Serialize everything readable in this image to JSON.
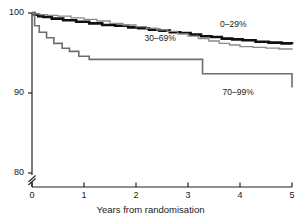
{
  "chart_data": {
    "type": "line",
    "title": "",
    "subtitle": "",
    "xlabel": "Years from randomisation",
    "ylabel": "",
    "xlim": [
      0,
      5
    ],
    "ylim": [
      80,
      100
    ],
    "y_axis_break": true,
    "y_axis_break_note": "axis broken below 80",
    "grid": false,
    "legend_position": "inline-annotations",
    "xticks": [
      "0",
      "1",
      "2",
      "3",
      "4",
      "5"
    ],
    "xtick_values": [
      0,
      1,
      2,
      3,
      4,
      5
    ],
    "yticks": [
      "100",
      "90",
      "80"
    ],
    "ytick_values": [
      100,
      90,
      80
    ],
    "series": [
      {
        "name": "0-29%",
        "label": "0–29%",
        "color": "#111111",
        "line_width": 2.6,
        "style": "step",
        "x": [
          0.0,
          0.05,
          0.12,
          0.22,
          0.38,
          0.6,
          0.85,
          1.1,
          1.35,
          1.6,
          1.85,
          2.05,
          2.25,
          2.45,
          2.65,
          2.85,
          3.05,
          3.25,
          3.45,
          3.65,
          3.85,
          4.05,
          4.3,
          4.55,
          4.8,
          5.0
        ],
        "y": [
          100.0,
          99.8,
          99.6,
          99.5,
          99.3,
          99.1,
          98.9,
          98.7,
          98.5,
          98.4,
          98.2,
          98.1,
          97.9,
          97.8,
          97.6,
          97.5,
          97.3,
          97.1,
          97.0,
          96.8,
          96.7,
          96.6,
          96.4,
          96.3,
          96.2,
          96.1
        ]
      },
      {
        "name": "30-69%",
        "label": "30–69%",
        "color": "#8a8a8a",
        "line_width": 1.3,
        "style": "step",
        "x": [
          0.0,
          0.06,
          0.15,
          0.3,
          0.5,
          0.75,
          1.0,
          1.25,
          1.5,
          1.75,
          2.0,
          2.2,
          2.4,
          2.6,
          2.8,
          3.0,
          3.2,
          3.4,
          3.6,
          3.8,
          4.0,
          4.25,
          4.5,
          4.75,
          5.0
        ],
        "y": [
          100.0,
          99.9,
          99.8,
          99.7,
          99.6,
          99.4,
          99.2,
          99.0,
          98.7,
          98.5,
          98.3,
          98.1,
          97.9,
          97.7,
          97.4,
          97.1,
          96.8,
          96.5,
          96.2,
          96.0,
          95.8,
          95.7,
          95.6,
          95.5,
          95.4
        ]
      },
      {
        "name": "70-99%",
        "label": "70–99%",
        "color": "#6e6e6e",
        "line_width": 1.6,
        "style": "step",
        "x": [
          0.0,
          0.05,
          0.14,
          0.28,
          0.42,
          0.58,
          0.72,
          0.9,
          1.1,
          3.05,
          3.28,
          5.0
        ],
        "y": [
          100.0,
          98.4,
          97.6,
          96.9,
          96.2,
          95.6,
          95.2,
          94.6,
          94.2,
          94.2,
          92.4,
          90.7
        ]
      }
    ],
    "annotations": [
      {
        "text": "0–29%",
        "x": 4.0,
        "y": 98.5,
        "name": "curve-label-0-29"
      },
      {
        "text": "30–69%",
        "x": 2.55,
        "y": 96.8,
        "name": "curve-label-30-69"
      },
      {
        "text": "70–99%",
        "x": 4.05,
        "y": 90.0,
        "name": "curve-label-70-99"
      }
    ]
  }
}
